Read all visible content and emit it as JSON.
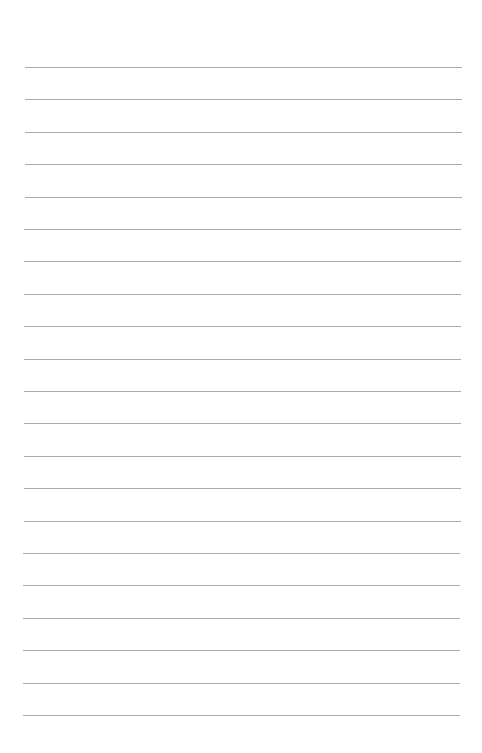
{
  "page": {
    "type": "lined-paper",
    "background_color": "#ffffff",
    "line_color": "#ababab",
    "line_count": 21,
    "first_line_y": 67,
    "line_spacing": 32.4,
    "line_left": 25,
    "line_right": 462
  }
}
